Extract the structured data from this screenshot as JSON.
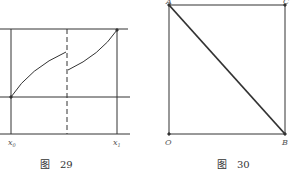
{
  "figures": [
    {
      "id": "fig29",
      "caption": "图　29",
      "labels": {
        "x0": "x",
        "x0_sub": "0",
        "x1": "x",
        "x1_sub": "1"
      },
      "description": "Piecewise increasing function between two horizontal lines with a jump discontinuity at a dashed vertical line"
    },
    {
      "id": "fig30",
      "caption": "图　30",
      "labels": {
        "A": "A",
        "C": "C",
        "O": "O",
        "B": "B"
      },
      "description": "Square OBCA with diagonal from A to B"
    }
  ],
  "colors": {
    "line": "#333333",
    "background": "#ffffff"
  }
}
